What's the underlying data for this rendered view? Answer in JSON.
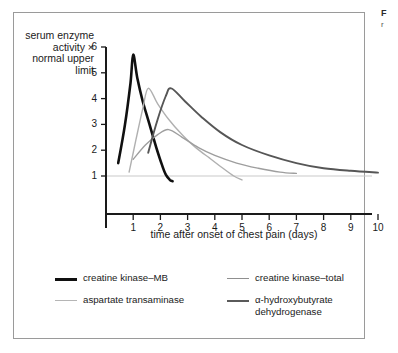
{
  "corner": {
    "mark": "F",
    "sub": "r"
  },
  "axes": {
    "ylabel": "serum enzyme activity × normal upper limit",
    "xlabel": "time after onset of chest pain (days)",
    "yticks": [
      "1",
      "2",
      "3",
      "4",
      "5",
      "6"
    ],
    "xticks": [
      "1",
      "2",
      "3",
      "4",
      "5",
      "6",
      "7",
      "8",
      "9",
      "10"
    ]
  },
  "legend": {
    "items": [
      {
        "label": "creatine kinase–MB",
        "color": "#101010",
        "width": 2.6
      },
      {
        "label": "creatine kinase–total",
        "color": "#8f8f8f",
        "width": 1.3
      },
      {
        "label": "aspartate transaminase",
        "color": "#b5b5b5",
        "width": 1.3
      },
      {
        "label": "α-hydroxybutyrate dehydrogenase",
        "color": "#5a5a5a",
        "width": 1.9
      }
    ]
  },
  "chart_data": {
    "type": "line",
    "title": "",
    "xlabel": "time after onset of chest pain (days)",
    "ylabel": "serum enzyme activity × normal upper limit",
    "xlim": [
      0,
      10.4
    ],
    "ylim": [
      0.6,
      6.2
    ],
    "grid": false,
    "legend_position": "bottom",
    "reference_line": {
      "y": 1,
      "label": "normal upper limit",
      "color": "#c9c9c9"
    },
    "series": [
      {
        "name": "creatine kinase–MB",
        "color": "#101010",
        "width": 2.6,
        "points": [
          [
            0.45,
            1.5
          ],
          [
            0.7,
            3.0
          ],
          [
            0.9,
            4.6
          ],
          [
            1.0,
            5.7
          ],
          [
            1.15,
            4.8
          ],
          [
            1.35,
            3.9
          ],
          [
            1.6,
            3.0
          ],
          [
            1.85,
            2.1
          ],
          [
            2.05,
            1.45
          ],
          [
            2.2,
            1.05
          ],
          [
            2.35,
            0.85
          ],
          [
            2.45,
            0.8
          ]
        ]
      },
      {
        "name": "creatine kinase–total",
        "color": "#b0b0b0",
        "width": 1.4,
        "points": [
          [
            0.85,
            1.15
          ],
          [
            1.1,
            2.4
          ],
          [
            1.35,
            3.6
          ],
          [
            1.55,
            4.4
          ],
          [
            1.9,
            3.8
          ],
          [
            2.3,
            3.2
          ],
          [
            2.8,
            2.6
          ],
          [
            3.3,
            2.1
          ],
          [
            3.8,
            1.7
          ],
          [
            4.3,
            1.3
          ],
          [
            4.7,
            1.0
          ],
          [
            5.0,
            0.85
          ]
        ]
      },
      {
        "name": "aspartate transaminase",
        "color": "#9e9e9e",
        "width": 1.4,
        "points": [
          [
            1.0,
            1.65
          ],
          [
            1.45,
            2.2
          ],
          [
            1.9,
            2.6
          ],
          [
            2.3,
            2.8
          ],
          [
            2.8,
            2.5
          ],
          [
            3.4,
            2.1
          ],
          [
            4.0,
            1.8
          ],
          [
            4.8,
            1.5
          ],
          [
            5.6,
            1.3
          ],
          [
            6.4,
            1.15
          ],
          [
            7.0,
            1.1
          ]
        ]
      },
      {
        "name": "α-hydroxybutyrate dehydrogenase",
        "color": "#565656",
        "width": 1.9,
        "points": [
          [
            1.55,
            1.9
          ],
          [
            1.9,
            3.2
          ],
          [
            2.2,
            4.1
          ],
          [
            2.4,
            4.4
          ],
          [
            2.9,
            3.9
          ],
          [
            3.5,
            3.3
          ],
          [
            4.2,
            2.7
          ],
          [
            5.0,
            2.2
          ],
          [
            6.0,
            1.8
          ],
          [
            7.0,
            1.5
          ],
          [
            8.0,
            1.3
          ],
          [
            9.0,
            1.2
          ],
          [
            10.0,
            1.13
          ]
        ]
      }
    ]
  }
}
